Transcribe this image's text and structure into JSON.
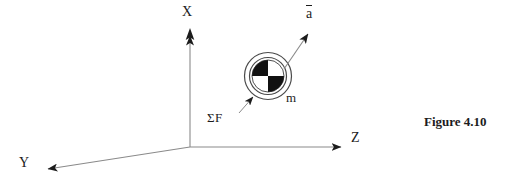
{
  "figure": {
    "caption": "Figure 4.10",
    "background_color": "#ffffff",
    "stroke_color": "#6b6b6b",
    "ink_color": "#1c1c1c",
    "width": 513,
    "height": 184
  },
  "axes": {
    "origin": {
      "x": 190,
      "y": 147
    },
    "x_axis": {
      "label": "X",
      "direction": "up",
      "tip": {
        "x": 190,
        "y": 30
      },
      "label_position": {
        "x": 182,
        "y": 5
      }
    },
    "y_axis": {
      "label": "Y",
      "direction": "down-left",
      "tip": {
        "x": 42,
        "y": 170
      },
      "label_position": {
        "x": 19,
        "y": 156
      }
    },
    "z_axis": {
      "label": "Z",
      "direction": "right",
      "tip": {
        "x": 347,
        "y": 147
      },
      "label_position": {
        "x": 351,
        "y": 131
      }
    }
  },
  "mass_body": {
    "label": "m",
    "symbol": "checkered-disc",
    "center": {
      "x": 268,
      "y": 76
    },
    "outer_radius": 24,
    "ring_radius": 19,
    "disc_radius": 16,
    "quadrant_fill": [
      "black",
      "white",
      "white",
      "black"
    ],
    "quadrant_order": "top-left, top-right, bottom-left, bottom-right",
    "label_position": {
      "x": 286,
      "y": 91
    }
  },
  "vectors": [
    {
      "name": "acceleration",
      "label": "a",
      "overbar": true,
      "from": {
        "x": 285,
        "y": 68
      },
      "to": {
        "x": 311,
        "y": 30
      },
      "label_position": {
        "x": 306,
        "y": 5
      }
    },
    {
      "name": "net-force",
      "label": "ΣF",
      "leader_from": {
        "x": 239,
        "y": 113
      },
      "leader_to": {
        "x": 255,
        "y": 94
      },
      "label_position": {
        "x": 207,
        "y": 111
      }
    }
  ]
}
